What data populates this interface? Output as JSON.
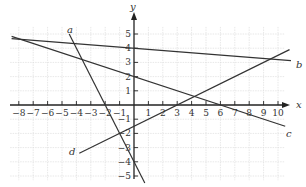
{
  "chart_data": {
    "type": "line",
    "title": "",
    "xlabel": "x",
    "ylabel": "y",
    "xlim": [
      -8.5,
      10.5
    ],
    "ylim": [
      -5.5,
      5.5
    ],
    "grid": true,
    "x_ticks": [
      -8,
      -7,
      -6,
      -5,
      -4,
      -3,
      -2,
      -1,
      1,
      2,
      3,
      4,
      5,
      6,
      7,
      8,
      9,
      10
    ],
    "y_ticks": [
      -5,
      -4,
      -3,
      -2,
      -1,
      1,
      2,
      3,
      4,
      5
    ],
    "series": [
      {
        "name": "a",
        "equation": "y = -2x - 4",
        "x": [
          -4.5,
          0.75
        ],
        "y": [
          5,
          -5.5
        ]
      },
      {
        "name": "b",
        "equation": "y ≈ 4 - 0.08x",
        "x": [
          -8.5,
          10.9
        ],
        "y": [
          4.68,
          3.13
        ]
      },
      {
        "name": "c",
        "equation": "y = 2 - x/3",
        "x": [
          -8.5,
          10.5
        ],
        "y": [
          4.83,
          -1.5
        ]
      },
      {
        "name": "d",
        "equation": "y = 0.5x - 1.5",
        "x": [
          -3.8,
          10.8
        ],
        "y": [
          -3.4,
          3.9
        ]
      }
    ],
    "legend": "inline labels a, b, c, d at line ends"
  },
  "labels": {
    "x_axis": "x",
    "y_axis": "y",
    "line_a": "a",
    "line_b": "b",
    "line_c": "c",
    "line_d": "d"
  },
  "colors": {
    "lines": "#333333",
    "grid": "#d6d6d6",
    "axes": "#222222"
  }
}
